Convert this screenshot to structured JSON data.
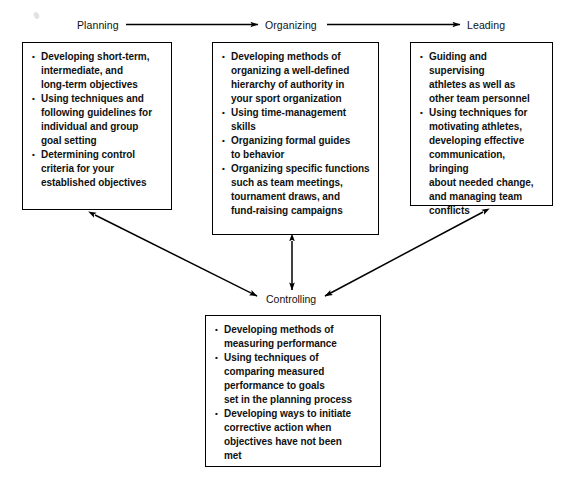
{
  "diagram": {
    "background_color": "#ffffff",
    "line_color": "#000000",
    "text_color": "#111111",
    "phases": [
      {
        "id": "planning",
        "label": "Planning"
      },
      {
        "id": "organizing",
        "label": "Organizing"
      },
      {
        "id": "leading",
        "label": "Leading"
      },
      {
        "id": "controlling",
        "label": "Controlling"
      }
    ],
    "boxes": {
      "planning": {
        "bullets": [
          "Developing short-term, intermediate, and long-term objectives",
          "Using techniques and following guidelines for individual and group goal setting",
          "Determining control criteria for your established objectives"
        ],
        "lines": [
          [
            "Developing short-term,",
            "intermediate, and",
            "long-term objectives"
          ],
          [
            "Using techniques and",
            "following guidelines for",
            "individual and group",
            "goal setting"
          ],
          [
            "Determining control",
            "criteria for your",
            "established objectives"
          ]
        ]
      },
      "organizing": {
        "bullets": [
          "Developing methods of organizing a well-defined hierarchy of authority in your sport organization",
          "Using time-management skills",
          "Organizing formal guides to behavior",
          "Organizing specific functions such as team meetings, tournament draws, and fund-raising campaigns"
        ],
        "lines": [
          [
            "Developing methods of",
            "organizing a well-defined",
            "hierarchy of authority in",
            "your sport organization"
          ],
          [
            "Using time-management",
            "skills"
          ],
          [
            "Organizing formal guides",
            "to behavior"
          ],
          [
            "Organizing specific functions",
            "such as team meetings,",
            "tournament draws, and",
            "fund-raising campaigns"
          ]
        ]
      },
      "leading": {
        "bullets": [
          "Guiding and supervising athletes as well as other team personnel",
          "Using techniques for motivating athletes, developing effective communication, bringing about needed change, and managing team conflicts"
        ],
        "lines": [
          [
            "Guiding and supervising",
            "athletes as well as",
            "other team personnel"
          ],
          [
            "Using techniques for",
            "motivating athletes,",
            "developing effective",
            "communication, bringing",
            "about needed change,",
            "and managing team",
            "conflicts"
          ]
        ]
      },
      "controlling": {
        "bullets": [
          "Developing methods of measuring performance",
          "Using techniques of comparing measured performance to goals set in the planning process",
          "Developing ways to initiate corrective action when objectives have not been met"
        ],
        "lines": [
          [
            "Developing methods of",
            "measuring performance"
          ],
          [
            "Using techniques of",
            "comparing measured",
            "performance to goals",
            "set in the planning process"
          ],
          [
            "Developing ways to initiate",
            "corrective action when",
            "objectives have not been",
            "met"
          ]
        ]
      }
    },
    "connectors": [
      {
        "id": "planning-to-organizing",
        "from": "planning",
        "to": "organizing",
        "style": "single-arrow-right"
      },
      {
        "id": "organizing-to-leading",
        "from": "organizing",
        "to": "leading",
        "style": "single-arrow-right"
      },
      {
        "id": "planning-controlling",
        "from": "planning-box",
        "to": "controlling",
        "style": "double-arrow"
      },
      {
        "id": "organizing-controlling",
        "from": "organizing-box",
        "to": "controlling",
        "style": "double-arrow"
      },
      {
        "id": "leading-controlling",
        "from": "leading-box",
        "to": "controlling",
        "style": "double-arrow"
      }
    ]
  }
}
